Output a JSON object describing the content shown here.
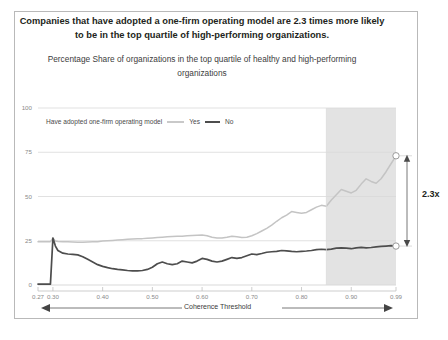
{
  "figure": {
    "title": "Companies that have adopted a one-firm operating model are 2.3 times more likely to be in the top quartile of high-performing organizations.",
    "subtitle": "Percentage Share of organizations in the top quartile of healthy and high-performing organizations",
    "legend_prefix": "Have adopted one-firm operating model",
    "annotation": "—One-firm threshold: 0.85",
    "annotation_lines": [
      "—One-firm",
      "threshold:",
      "0.85"
    ],
    "ratio_label": "2.3x",
    "border_color": "#b9b9b9"
  },
  "chart_data": {
    "type": "line",
    "title": "Percentage Share of organizations in the top quartile of healthy and high-performing organizations",
    "xlabel": "Coherence Threshold",
    "ylabel": "",
    "xlim": [
      0.27,
      0.99
    ],
    "ylim": [
      0,
      100
    ],
    "grid": true,
    "legend_position": "top-left",
    "xticks": [
      "0.27",
      "0.30",
      "0.40",
      "0.50",
      "0.60",
      "0.70",
      "0.80",
      "0.90",
      "0.99"
    ],
    "xtick_values": [
      0.27,
      0.3,
      0.4,
      0.5,
      0.6,
      0.7,
      0.8,
      0.9,
      0.99
    ],
    "yticks": [
      "0",
      "25",
      "50",
      "75",
      "100"
    ],
    "ytick_values": [
      0,
      25,
      50,
      75,
      100
    ],
    "shaded_region": {
      "x_start": 0.85,
      "x_end": 0.99,
      "color": "#e3e3e3",
      "label": "One-firm threshold: 0.85"
    },
    "annotations": [
      {
        "text": "2.3x",
        "x": 0.99,
        "y_from": 22,
        "y_to": 73,
        "type": "double-arrow"
      }
    ],
    "x": [
      0.27,
      0.28,
      0.29,
      0.295,
      0.3,
      0.305,
      0.31,
      0.32,
      0.33,
      0.34,
      0.35,
      0.36,
      0.37,
      0.38,
      0.39,
      0.4,
      0.41,
      0.42,
      0.43,
      0.44,
      0.45,
      0.46,
      0.47,
      0.48,
      0.49,
      0.5,
      0.51,
      0.52,
      0.53,
      0.54,
      0.55,
      0.56,
      0.57,
      0.58,
      0.59,
      0.6,
      0.61,
      0.62,
      0.63,
      0.64,
      0.65,
      0.66,
      0.67,
      0.68,
      0.69,
      0.7,
      0.71,
      0.72,
      0.73,
      0.74,
      0.75,
      0.76,
      0.77,
      0.78,
      0.79,
      0.8,
      0.81,
      0.82,
      0.83,
      0.84,
      0.85,
      0.86,
      0.87,
      0.88,
      0.89,
      0.9,
      0.91,
      0.92,
      0.93,
      0.94,
      0.95,
      0.96,
      0.97,
      0.98,
      0.99
    ],
    "series": [
      {
        "name": "Yes",
        "color": "#c4c4c4",
        "values": [
          24.5,
          24.5,
          24.5,
          24.5,
          26.5,
          24.8,
          24.6,
          24.5,
          24.4,
          24.3,
          24.2,
          24.2,
          24.3,
          24.4,
          24.5,
          24.8,
          25.0,
          25.2,
          25.4,
          25.6,
          25.8,
          26.0,
          26.1,
          26.2,
          26.4,
          26.6,
          26.8,
          27.0,
          27.2,
          27.4,
          27.5,
          27.6,
          27.8,
          28.0,
          28.1,
          28.2,
          27.8,
          27.0,
          26.6,
          26.5,
          27.0,
          27.6,
          27.2,
          26.8,
          27.0,
          27.8,
          29.0,
          30.5,
          32.0,
          33.8,
          36.0,
          38.0,
          39.5,
          41.5,
          41.0,
          40.5,
          41.0,
          42.5,
          44.0,
          45.0,
          44.5,
          48.0,
          51.0,
          54.0,
          53.0,
          52.0,
          53.5,
          57.0,
          60.0,
          58.5,
          57.5,
          60.0,
          64.0,
          68.5,
          73.0
        ]
      },
      {
        "name": "No",
        "color": "#4d4d4d",
        "values": [
          0.5,
          0.5,
          0.5,
          0.5,
          26.5,
          22.0,
          19.5,
          18.0,
          17.5,
          17.3,
          17.0,
          16.0,
          14.5,
          13.0,
          11.5,
          10.5,
          9.8,
          9.2,
          8.8,
          8.5,
          8.2,
          8.0,
          8.0,
          8.2,
          8.8,
          10.0,
          12.0,
          13.0,
          12.0,
          11.5,
          12.0,
          13.5,
          13.0,
          12.5,
          13.5,
          15.0,
          14.5,
          13.5,
          13.0,
          13.5,
          14.5,
          15.5,
          15.0,
          15.5,
          16.5,
          17.5,
          17.2,
          17.8,
          18.5,
          18.8,
          19.0,
          19.5,
          19.3,
          19.0,
          18.8,
          19.0,
          19.2,
          19.5,
          20.0,
          20.2,
          20.0,
          20.3,
          20.8,
          21.0,
          20.8,
          20.5,
          21.0,
          21.3,
          21.0,
          21.2,
          21.5,
          21.8,
          22.0,
          22.2,
          22.0
        ]
      }
    ],
    "endpoint_markers": [
      {
        "series": "Yes",
        "x": 0.99,
        "y": 73
      },
      {
        "series": "No",
        "x": 0.99,
        "y": 22
      }
    ]
  }
}
